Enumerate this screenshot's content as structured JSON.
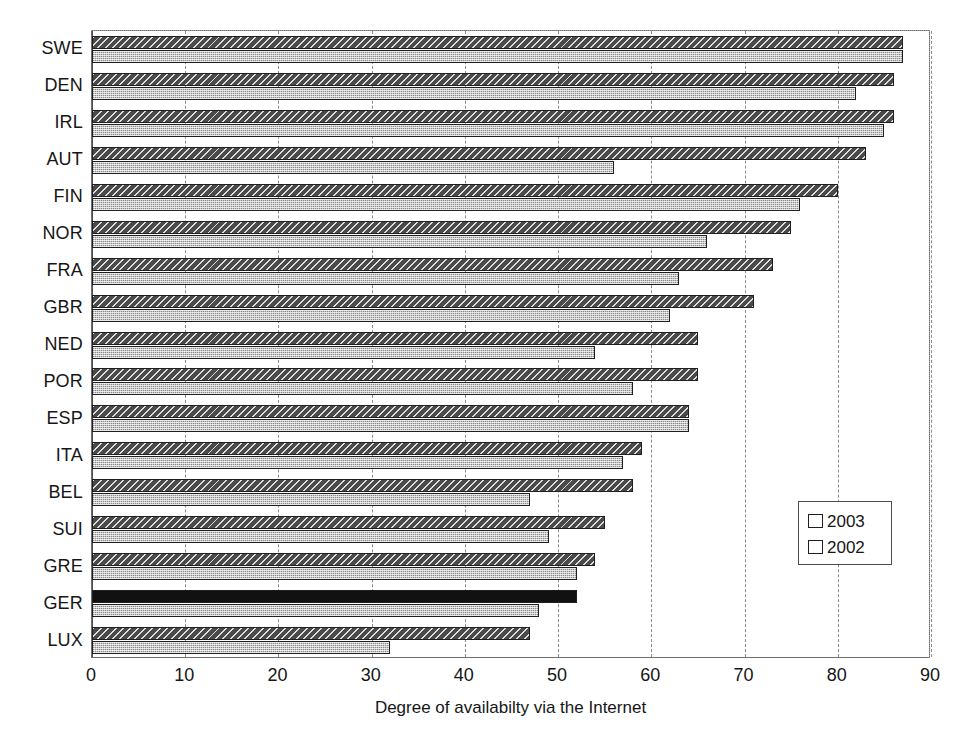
{
  "chart_data": {
    "type": "bar",
    "orientation": "horizontal",
    "title": "",
    "subtitle": "",
    "xlabel": "Degree of availabilty via the Internet",
    "ylabel": "",
    "xlim": [
      0,
      90
    ],
    "xticks": [
      0,
      10,
      20,
      30,
      40,
      50,
      60,
      70,
      80,
      90
    ],
    "xtick_labels": [
      "0",
      "10",
      "20",
      "30",
      "40",
      "50",
      "60",
      "70",
      "80",
      "90"
    ],
    "grid": "vertical-dashed",
    "legend_position": "center-right",
    "categories": [
      "SWE",
      "DEN",
      "IRL",
      "AUT",
      "FIN",
      "NOR",
      "FRA",
      "GBR",
      "NED",
      "POR",
      "ESP",
      "ITA",
      "BEL",
      "SUI",
      "GRE",
      "GER",
      "LUX"
    ],
    "series": [
      {
        "name": "2003",
        "color": "#4a4a4a",
        "pattern": "diagonal-hatch",
        "values": [
          87,
          86,
          86,
          83,
          80,
          75,
          73,
          71,
          65,
          65,
          64,
          59,
          58,
          55,
          54,
          52,
          47
        ]
      },
      {
        "name": "2002",
        "color": "#c6c6c6",
        "pattern": "stipple",
        "values": [
          87,
          82,
          85,
          56,
          76,
          66,
          63,
          62,
          54,
          58,
          64,
          57,
          47,
          49,
          52,
          48,
          32
        ]
      }
    ],
    "highlight": {
      "category": "GER",
      "series": "2003",
      "color": "#111111"
    },
    "legend": [
      {
        "label": "2003",
        "swatch": "dark-hatch-swatch"
      },
      {
        "label": "2002",
        "swatch": "light-stipple-swatch"
      }
    ]
  }
}
